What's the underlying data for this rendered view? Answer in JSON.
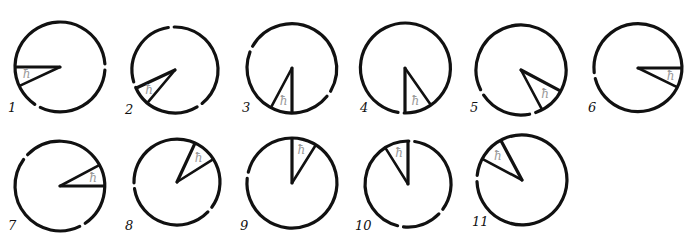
{
  "figure": {
    "wedge_symbol": "ħ",
    "colors": {
      "stroke": "#111111",
      "symbol": "#9a9a9a",
      "background": "#ffffff"
    },
    "panels": [
      {
        "label": "1",
        "cx": 60,
        "cy": 67,
        "r": 45,
        "a1": 180,
        "a2": 155,
        "gaps": [
          0,
          120
        ],
        "lx": 8,
        "ly": 112
      },
      {
        "label": "2",
        "cx": 175,
        "cy": 70,
        "r": 43,
        "a1": 155,
        "a2": 130,
        "gaps": [
          -95,
          55,
          160
        ],
        "lx": 125,
        "ly": 114
      },
      {
        "label": "3",
        "cx": 292,
        "cy": 68,
        "r": 45,
        "a1": 90,
        "a2": 118,
        "gaps": [
          -155,
          35
        ],
        "lx": 242,
        "ly": 112
      },
      {
        "label": "4",
        "cx": 405,
        "cy": 68,
        "r": 45,
        "a1": 90,
        "a2": 55,
        "gaps": [
          95
        ],
        "lx": 360,
        "ly": 112
      },
      {
        "label": "5",
        "cx": 521,
        "cy": 70,
        "r": 45,
        "a1": 28,
        "a2": 62,
        "gaps": [
          75,
          150
        ],
        "lx": 470,
        "ly": 112
      },
      {
        "label": "6",
        "cx": 638,
        "cy": 68,
        "r": 44,
        "a1": 0,
        "a2": 26,
        "gaps": [
          170
        ],
        "lx": 588,
        "ly": 112
      },
      {
        "label": "7",
        "cx": 60,
        "cy": 186,
        "r": 45,
        "a1": 0,
        "a2": -28,
        "gaps": [
          -140,
          60
        ],
        "lx": 8,
        "ly": 230
      },
      {
        "label": "8",
        "cx": 177,
        "cy": 182,
        "r": 43,
        "a1": -65,
        "a2": -32,
        "gaps": [
          175,
          40
        ],
        "lx": 125,
        "ly": 230
      },
      {
        "label": "9",
        "cx": 292,
        "cy": 183,
        "r": 45,
        "a1": -90,
        "a2": -58,
        "gaps": [
          -170
        ],
        "lx": 240,
        "ly": 230
      },
      {
        "label": "10",
        "cx": 408,
        "cy": 184,
        "r": 43,
        "a1": -90,
        "a2": -122,
        "gaps": [
          -85,
          40,
          100
        ],
        "lx": 355,
        "ly": 230
      },
      {
        "label": "11",
        "cx": 522,
        "cy": 180,
        "r": 45,
        "a1": -118,
        "a2": -152,
        "gaps": [
          -178
        ],
        "lx": 472,
        "ly": 226
      }
    ]
  }
}
